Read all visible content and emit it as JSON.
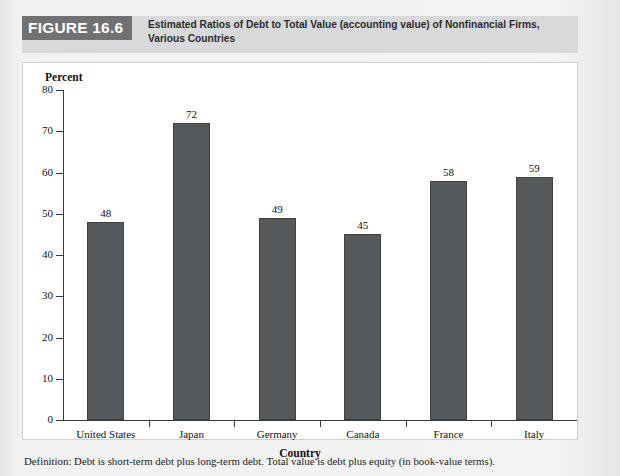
{
  "header": {
    "badge": "FIGURE 16.6",
    "caption_line1": "Estimated Ratios of Debt to Total Value (accounting value) of Nonfinancial Firms,",
    "caption_line2": "Various Countries",
    "badge_bg": "#6f7173",
    "band_bg": "#d8d9da"
  },
  "footnote": "Definition: Debt is short-term debt plus long-term debt. Total value is debt plus equity (in book-value terms).",
  "chart_data": {
    "type": "bar",
    "title": "Estimated Ratios of Debt to Total Value (accounting value) of Nonfinancial Firms, Various Countries",
    "categories": [
      "United States",
      "Japan",
      "Germany",
      "Canada",
      "France",
      "Italy"
    ],
    "values": [
      48,
      72,
      49,
      45,
      58,
      59
    ],
    "xlabel": "Country",
    "ylabel": "Percent",
    "ylim": [
      0,
      80
    ],
    "yticks": [
      0,
      10,
      20,
      30,
      40,
      50,
      60,
      70,
      80
    ],
    "ytick_labels": [
      "0",
      "10",
      "20",
      "30",
      "40",
      "50",
      "60",
      "70",
      "80"
    ],
    "grid": false,
    "legend": false,
    "bar_color": "#56595b",
    "data_labels": [
      "48",
      "72",
      "49",
      "45",
      "58",
      "59"
    ]
  }
}
